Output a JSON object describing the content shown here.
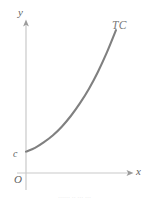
{
  "figure": {
    "caption_partial": "······    ·· ··· ···",
    "background_color": "#ffffff",
    "axis_color": "#c9c9c9",
    "curve_color": "#808080",
    "label_color": "#5f5f5f"
  },
  "labels": {
    "y_axis": "y",
    "x_axis": "x",
    "origin": "O",
    "y_intercept": "c",
    "curve": "TC"
  },
  "chart_data": {
    "type": "line",
    "title": "",
    "subtitle": "",
    "xlabel": "x",
    "ylabel": "y",
    "xlim": [
      0,
      12
    ],
    "ylim": [
      0,
      12
    ],
    "grid": false,
    "legend": "none",
    "axes": {
      "origin_label": "O",
      "x_axis_arrow": true,
      "y_axis_arrow": true,
      "x_ticks": [],
      "y_ticks": [],
      "y_tick_labels": [
        "c"
      ],
      "y_intercept_value_label": "c"
    },
    "annotations": [
      {
        "text": "TC",
        "x": 10.6,
        "y": 11.4,
        "style": "italic",
        "color": "#7a7a7a"
      },
      {
        "text": "c",
        "x": -0.4,
        "y": 1.7,
        "style": "italic",
        "color": "#5f5f5f"
      },
      {
        "text": "O",
        "x": -0.5,
        "y": -0.6,
        "style": "italic",
        "color": "#5f5f5f"
      },
      {
        "text": "y",
        "x": -0.3,
        "y": 12.3,
        "style": "italic",
        "color": "#5f5f5f"
      },
      {
        "text": "x",
        "x": 12.4,
        "y": -0.1,
        "style": "italic",
        "color": "#5f5f5f"
      }
    ],
    "series": [
      {
        "name": "TC",
        "description": "Total cost curve: increasing and convex, starting at fixed cost c on the vertical axis",
        "color": "#808080",
        "x": [
          0.0,
          1.0,
          2.0,
          3.0,
          4.0,
          5.0,
          6.0,
          7.0,
          8.0,
          9.0,
          10.0
        ],
        "y": [
          1.7,
          2.0,
          2.45,
          3.0,
          3.7,
          4.55,
          5.55,
          6.7,
          8.05,
          9.6,
          11.35
        ]
      }
    ]
  }
}
